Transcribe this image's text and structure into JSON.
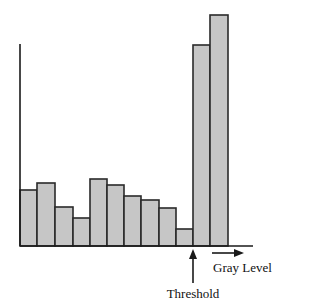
{
  "chart_data": {
    "type": "bar",
    "title": "",
    "xlabel": "Gray Level",
    "ylabel": "",
    "categories": [
      "1",
      "2",
      "3",
      "4",
      "5",
      "6",
      "7",
      "8",
      "9",
      "10",
      "11",
      "12"
    ],
    "values": [
      56,
      63,
      39,
      28,
      67,
      61,
      50,
      46,
      38,
      17,
      201,
      231
    ],
    "ylim": [
      0,
      240
    ],
    "grid": false,
    "legend": "none",
    "annotations": [
      {
        "text": "Threshold",
        "type": "arrow",
        "points_to": "boundary between bar 10 and bar 11"
      }
    ],
    "axis_ticks": "none"
  },
  "labels": {
    "x_axis": "Gray Level",
    "threshold": "Threshold"
  },
  "colors": {
    "bar_fill": "#c6c6c6",
    "bar_stroke": "#2a2a2a",
    "axis": "#1a1a1a"
  },
  "layout": {
    "baseline_y": 246,
    "axis_x": 20,
    "axis_top": 44,
    "axis_right": 253,
    "bar_edges": [
      20,
      37,
      55,
      73,
      90,
      107,
      124,
      141,
      159,
      176,
      193,
      210,
      228
    ]
  }
}
